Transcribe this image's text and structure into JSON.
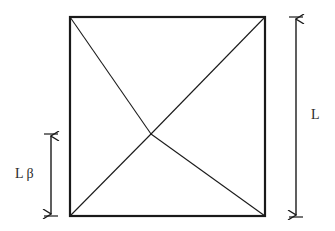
{
  "diagram": {
    "colors": {
      "stroke": "#1a1a1a",
      "background": "#ffffff"
    },
    "square": {
      "x1": 70,
      "y1": 17,
      "x2": 265,
      "y2": 216
    },
    "intersection": {
      "x": 151,
      "y": 134
    },
    "labels": {
      "left_dimension": "L β",
      "right_dimension": "L"
    },
    "dimensions": {
      "right": {
        "x": 296,
        "y_top": 18,
        "y_bottom": 216,
        "label": "L"
      },
      "left": {
        "x": 51,
        "y_top": 134,
        "y_bottom": 216,
        "label": "L β"
      }
    }
  }
}
